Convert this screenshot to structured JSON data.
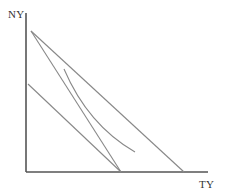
{
  "diagram": {
    "y_axis_label": "NY",
    "x_axis_label": "TY",
    "colors": {
      "axis": "#555555",
      "line": "#888888",
      "label": "#333333"
    },
    "axes": {
      "origin": [
        26,
        172
      ],
      "y_top": [
        26,
        13
      ],
      "x_right": [
        208,
        172
      ]
    },
    "lines": [
      {
        "name": "outer-budget-line",
        "from": [
          31,
          31
        ],
        "to": [
          184,
          172
        ]
      },
      {
        "name": "steep-budget-line",
        "from": [
          31,
          31
        ],
        "to": [
          121,
          172
        ]
      },
      {
        "name": "lower-parallel-line",
        "from": [
          28,
          84
        ],
        "to": [
          121,
          172
        ]
      }
    ],
    "curves": [
      {
        "name": "transformation-curve",
        "from": [
          64,
          69
        ],
        "control": [
          90,
          125
        ],
        "to": [
          135,
          152
        ]
      }
    ]
  }
}
